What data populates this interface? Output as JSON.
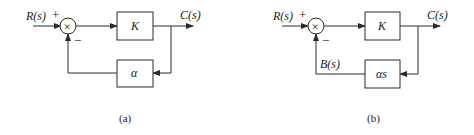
{
  "diagrams": [
    {
      "id": "a",
      "caption": "(a)",
      "input_label": "R(s)",
      "output_label": "C(s)",
      "plus_sign": "+",
      "minus_sign": "−",
      "summing_junction_symbol": "×",
      "forward_block": "K",
      "feedback_block": "α",
      "feedback_signal_label": ""
    },
    {
      "id": "b",
      "caption": "(b)",
      "input_label": "R(s)",
      "output_label": "C(s)",
      "plus_sign": "+",
      "minus_sign": "−",
      "summing_junction_symbol": "×",
      "forward_block": "K",
      "feedback_block": "αs",
      "feedback_signal_label": "B(s)"
    }
  ],
  "colors": {
    "line": "#2b2b2b",
    "background": "#ffffff"
  }
}
